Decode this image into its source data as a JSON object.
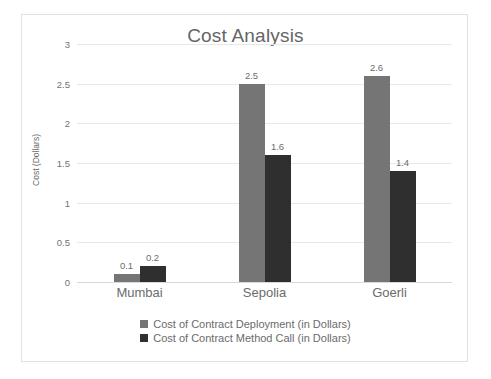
{
  "chart_data": {
    "type": "bar",
    "title": "Cost Analysis",
    "xlabel": "",
    "ylabel": "Cost (Dollars)",
    "categories": [
      "Mumbai",
      "Sepolia",
      "Goerli"
    ],
    "series": [
      {
        "name": "Cost of Contract Deployment (in Dollars)",
        "color": "#757575",
        "values": [
          0.1,
          2.5,
          2.6
        ]
      },
      {
        "name": "Cost of Contract Method Call (in Dollars)",
        "color": "#2f2f2f",
        "values": [
          0.2,
          1.6,
          1.4
        ]
      }
    ],
    "ylim": [
      0,
      3
    ],
    "yticks": [
      3,
      2.5,
      2,
      1.5,
      1,
      0.5,
      0
    ],
    "ytick_labels": [
      "3",
      "2.5",
      "2",
      "1.5",
      "1",
      "0.5",
      "0"
    ],
    "grid": true,
    "legend_position": "bottom",
    "data_labels": [
      [
        "0.1",
        "0.2"
      ],
      [
        "2.5",
        "1.6"
      ],
      [
        "2.6",
        "1.4"
      ]
    ]
  }
}
